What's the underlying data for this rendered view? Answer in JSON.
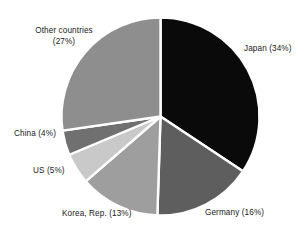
{
  "chart_data": {
    "type": "pie",
    "title": "",
    "subtitle": "",
    "xlabel": "",
    "ylabel": "",
    "legend_position": "none",
    "grid": false,
    "start_angle_deg": 0,
    "direction": "clockwise",
    "unit": "%",
    "categories": [
      "Japan",
      "Germany",
      "Korea, Rep.",
      "US",
      "China",
      "Other countries"
    ],
    "values": [
      34,
      16,
      13,
      5,
      4,
      27
    ],
    "labels": [
      "Japan (34%)",
      "Germany (16%)",
      "Korea, Rep. (13%)",
      "US (5%)",
      "China (4%)",
      "Other countries (27%)"
    ],
    "slice_colors": [
      "#0a0a0a",
      "#5e5e5e",
      "#9e9e9e",
      "#c9c9c9",
      "#707070",
      "#8e8e8e"
    ],
    "separator_color": "#ffffff",
    "background_color": "#ffffff",
    "label_color": "#1a1a1a"
  },
  "labels": {
    "japan": "Japan (34%)",
    "germany": "Germany (16%)",
    "korea": "Korea, Rep. (13%)",
    "us": "US (5%)",
    "china": "China (4%)",
    "other_line1": "Other countries",
    "other_line2": "(27%)"
  }
}
